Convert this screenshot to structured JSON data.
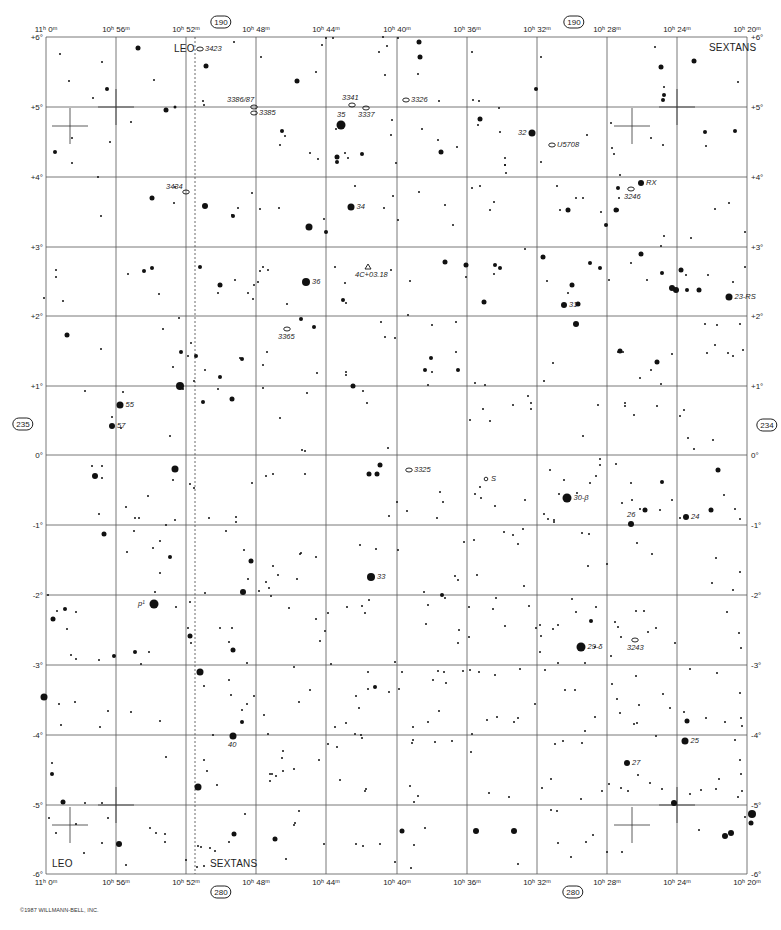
{
  "chart_data": {
    "type": "star_chart",
    "title": "",
    "constellations": [
      "LEO",
      "SEXTANS"
    ],
    "ra_axis": {
      "labels_top": [
        "11h 0m",
        "10h 56m",
        "10h 52m",
        "10h 48m",
        "10h 44m",
        "10h 40m",
        "10h 36m",
        "10h 32m",
        "10h 28m",
        "10h 24m",
        "10h 20m"
      ],
      "labels_bottom": [
        "11h 0m",
        "10h 56m",
        "10h 52m",
        "10h 48m",
        "10h 44m",
        "10h 40m",
        "10h 36m",
        "10h 32m",
        "10h 28m",
        "10h 24m",
        "10h 20m"
      ]
    },
    "dec_axis": {
      "labels": [
        "+6°",
        "+5°",
        "+4°",
        "+3°",
        "+2°",
        "+1°",
        "0°",
        "-1°",
        "-2°",
        "-3°",
        "-4°",
        "-5°",
        "-6°"
      ],
      "range": [
        6,
        -6
      ]
    },
    "grid": true,
    "boundary_line": "dashed line near RA 10h 51.5m separating LEO and SEXTANS"
  },
  "chart": {
    "ra_top": [
      {
        "h": "11",
        "m": "0"
      },
      {
        "h": "10",
        "m": "56"
      },
      {
        "h": "10",
        "m": "52"
      },
      {
        "h": "10",
        "m": "48"
      },
      {
        "h": "10",
        "m": "44"
      },
      {
        "h": "10",
        "m": "40"
      },
      {
        "h": "10",
        "m": "36"
      },
      {
        "h": "10",
        "m": "32"
      },
      {
        "h": "10",
        "m": "28"
      },
      {
        "h": "10",
        "m": "24"
      },
      {
        "h": "10",
        "m": "20"
      }
    ],
    "dec_labels": [
      "+6°",
      "+5°",
      "+4°",
      "+3°",
      "+2°",
      "+1°",
      "0°",
      "-1°",
      "-2°",
      "-3°",
      "-4°",
      "-5°",
      "-6°"
    ],
    "page_refs": {
      "top": "190",
      "top_right": "190",
      "bottom": "280",
      "bottom_right": "280",
      "left": "235",
      "right": "234"
    },
    "constellation_labels": {
      "leo_top": "LEO",
      "sextans_top": "SEXTANS",
      "leo_bottom": "LEO",
      "sextans_bottom": "SEXTANS"
    },
    "objects": [
      {
        "label": "3423",
        "type": "galaxy",
        "x": 200,
        "y": 49
      },
      {
        "label": "3386/87",
        "type": "galaxy",
        "x": 254,
        "y": 107
      },
      {
        "label": "3385",
        "type": "galaxy",
        "x": 254,
        "y": 113
      },
      {
        "label": "3341",
        "type": "galaxy",
        "x": 352,
        "y": 105
      },
      {
        "label": "3337",
        "type": "galaxy",
        "x": 366,
        "y": 108
      },
      {
        "label": "3326",
        "type": "galaxy",
        "x": 406,
        "y": 100
      },
      {
        "label": "U5708",
        "type": "galaxy",
        "x": 552,
        "y": 145
      },
      {
        "label": "3434",
        "type": "galaxy",
        "x": 186,
        "y": 192
      },
      {
        "label": "3246",
        "type": "galaxy",
        "x": 631,
        "y": 189
      },
      {
        "label": "4C+03.18",
        "type": "quasar",
        "x": 368,
        "y": 267
      },
      {
        "label": "3365",
        "type": "galaxy",
        "x": 287,
        "y": 329
      },
      {
        "label": "3325",
        "type": "galaxy",
        "x": 409,
        "y": 470
      },
      {
        "label": "S",
        "type": "variable",
        "x": 486,
        "y": 479
      },
      {
        "label": "3243",
        "type": "galaxy",
        "x": 635,
        "y": 640
      }
    ],
    "named_stars": [
      {
        "label": "35",
        "x": 341,
        "y": 125,
        "r": 4.5
      },
      {
        "label": "32",
        "x": 532,
        "y": 133,
        "r": 3.5
      },
      {
        "label": "RX",
        "x": 641,
        "y": 183,
        "r": 3
      },
      {
        "label": "34",
        "x": 351,
        "y": 207,
        "r": 3.5
      },
      {
        "label": "36",
        "x": 306,
        "y": 282,
        "r": 4
      },
      {
        "label": "31",
        "x": 564,
        "y": 305,
        "r": 3
      },
      {
        "label": "23-RS",
        "x": 729,
        "y": 297,
        "r": 3.5
      },
      {
        "label": "55",
        "x": 120,
        "y": 405,
        "r": 3.5
      },
      {
        "label": "57",
        "x": 112,
        "y": 426,
        "r": 3
      },
      {
        "label": "30-β",
        "x": 567,
        "y": 498,
        "r": 4.5
      },
      {
        "label": "26",
        "x": 631,
        "y": 524,
        "r": 3
      },
      {
        "label": "24",
        "x": 686,
        "y": 517,
        "r": 3
      },
      {
        "label": "33",
        "x": 371,
        "y": 577,
        "r": 4
      },
      {
        "label": "p¹",
        "x": 154,
        "y": 604,
        "r": 4.5
      },
      {
        "label": "29-δ",
        "x": 581,
        "y": 647,
        "r": 4.5
      },
      {
        "label": "40",
        "x": 233,
        "y": 736,
        "r": 3.5
      },
      {
        "label": "25",
        "x": 685,
        "y": 741,
        "r": 3.5
      },
      {
        "label": "27",
        "x": 627,
        "y": 763,
        "r": 3
      }
    ],
    "copyright": "©1987 WILLMANN-BELL, INC."
  }
}
